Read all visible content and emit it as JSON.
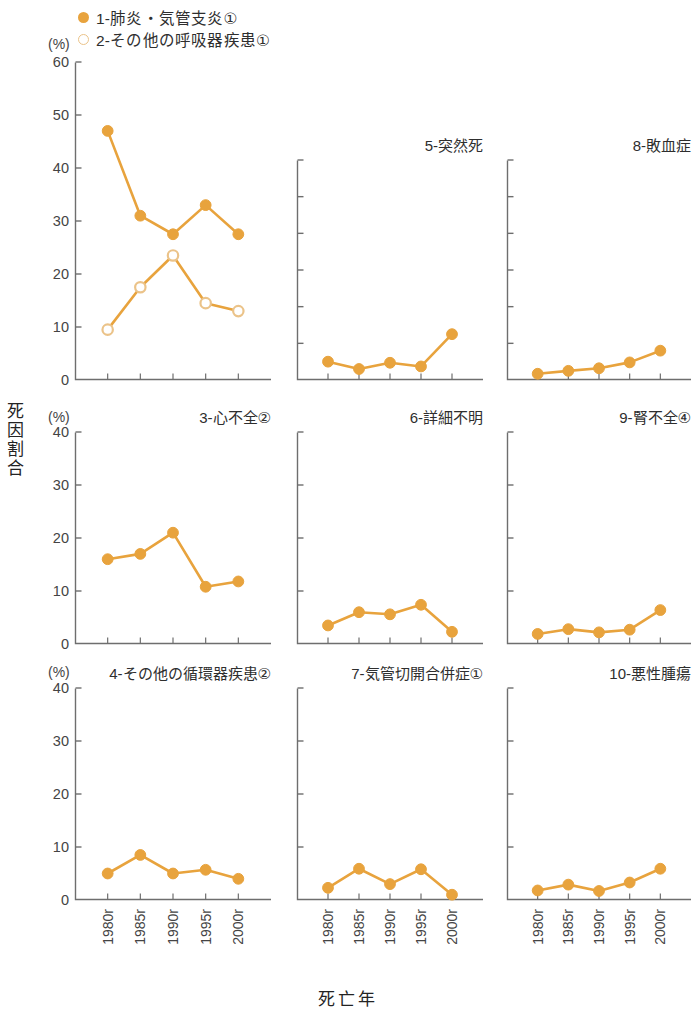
{
  "legend": {
    "items": [
      {
        "label": "1-肺炎・気管支炎①",
        "marker": "filled-circle",
        "color": "#E8A33D"
      },
      {
        "label": "2-その他の呼吸器疾患①",
        "marker": "open-circle",
        "color": "#EBC389"
      }
    ]
  },
  "axes": {
    "y_title": "死因割合",
    "x_title": "死亡年",
    "unit_label": "(%)"
  },
  "chart_data": {
    "type": "line",
    "xlabel": "死亡年",
    "ylabel": "死因割合",
    "unit": "(%)",
    "grid": false,
    "legend_position": "top-left",
    "categories": [
      "1980r",
      "1985r",
      "1990r",
      "1995r",
      "2000r"
    ],
    "panels": [
      {
        "id": 1,
        "title": "1-肺炎・気管支炎①",
        "title_in_legend": true,
        "ylim": [
          0,
          60
        ],
        "yticks": [
          0,
          10,
          20,
          30,
          40,
          50,
          60
        ],
        "ytick_labels": [
          "0",
          "10",
          "20",
          "30",
          "40",
          "50",
          "60"
        ],
        "unit_label": "(%)",
        "series": [
          {
            "name": "1-肺炎・気管支炎①",
            "marker": "filled-circle",
            "values": [
              47,
              31,
              27.5,
              33,
              27.5
            ]
          },
          {
            "name": "2-その他の呼吸器疾患①",
            "marker": "open-circle",
            "values": [
              9.5,
              17.5,
              23.5,
              14.5,
              13
            ]
          }
        ]
      },
      {
        "id": 5,
        "title": "5-突然死",
        "ylim": [
          0,
          60
        ],
        "yticks": [
          0,
          10,
          20,
          30,
          40,
          50,
          60
        ],
        "ytick_labels": [
          "",
          "",
          "",
          "",
          "",
          "",
          ""
        ],
        "series": [
          {
            "name": "5-突然死",
            "marker": "filled-circle",
            "values": [
              5,
              3,
              4.7,
              3.7,
              12.5
            ]
          }
        ]
      },
      {
        "id": 8,
        "title": "8-敗血症",
        "ylim": [
          0,
          60
        ],
        "yticks": [
          0,
          10,
          20,
          30,
          40,
          50,
          60
        ],
        "ytick_labels": [
          "",
          "",
          "",
          "",
          "",
          "",
          ""
        ],
        "series": [
          {
            "name": "8-敗血症",
            "marker": "filled-circle",
            "values": [
              1.7,
              2.5,
              3.2,
              4.8,
              8
            ]
          }
        ]
      },
      {
        "id": 3,
        "title": "3-心不全②",
        "ylim": [
          0,
          40
        ],
        "yticks": [
          0,
          10,
          20,
          30,
          40
        ],
        "ytick_labels": [
          "0",
          "10",
          "20",
          "30",
          "40"
        ],
        "unit_label": "(%)",
        "series": [
          {
            "name": "3-心不全②",
            "marker": "filled-circle",
            "values": [
              16,
              17,
              21,
              10.8,
              11.8
            ]
          }
        ]
      },
      {
        "id": 6,
        "title": "6-詳細不明",
        "ylim": [
          0,
          40
        ],
        "yticks": [
          0,
          10,
          20,
          30,
          40
        ],
        "ytick_labels": [
          "",
          "",
          "",
          "",
          ""
        ],
        "series": [
          {
            "name": "6-詳細不明",
            "marker": "filled-circle",
            "values": [
              3.5,
              6,
              5.6,
              7.4,
              2.3
            ]
          }
        ]
      },
      {
        "id": 9,
        "title": "9-腎不全④",
        "ylim": [
          0,
          40
        ],
        "yticks": [
          0,
          10,
          20,
          30,
          40
        ],
        "ytick_labels": [
          "",
          "",
          "",
          "",
          ""
        ],
        "series": [
          {
            "name": "9-腎不全④",
            "marker": "filled-circle",
            "values": [
              1.9,
              2.8,
              2.2,
              2.7,
              6.4
            ]
          }
        ]
      },
      {
        "id": 4,
        "title": "4-その他の循環器疾患②",
        "ylim": [
          0,
          40
        ],
        "yticks": [
          0,
          10,
          20,
          30,
          40
        ],
        "ytick_labels": [
          "0",
          "10",
          "20",
          "30",
          "40"
        ],
        "unit_label": "(%)",
        "series": [
          {
            "name": "4-その他の循環器疾患②",
            "marker": "filled-circle",
            "values": [
              5,
              8.5,
              5,
              5.7,
              4
            ]
          }
        ]
      },
      {
        "id": 7,
        "title": "7-気管切開合併症①",
        "ylim": [
          0,
          40
        ],
        "yticks": [
          0,
          10,
          20,
          30,
          40
        ],
        "ytick_labels": [
          "",
          "",
          "",
          "",
          ""
        ],
        "series": [
          {
            "name": "7-気管切開合併症①",
            "marker": "filled-circle",
            "values": [
              2.3,
              5.9,
              3,
              5.8,
              1
            ]
          }
        ]
      },
      {
        "id": 10,
        "title": "10-悪性腫瘍",
        "ylim": [
          0,
          40
        ],
        "yticks": [
          0,
          10,
          20,
          30,
          40
        ],
        "ytick_labels": [
          "",
          "",
          "",
          "",
          ""
        ],
        "series": [
          {
            "name": "10-悪性腫瘍",
            "marker": "filled-circle",
            "values": [
              1.8,
              2.9,
              1.7,
              3.3,
              5.9
            ]
          }
        ]
      }
    ]
  }
}
